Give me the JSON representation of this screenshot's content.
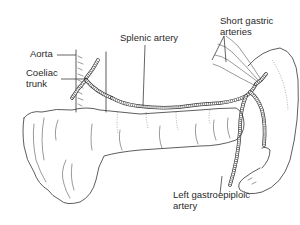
{
  "figure": {
    "labels": {
      "aorta": "Aorta",
      "coeliac_trunk_line1": "Coeliac",
      "coeliac_trunk_line2": "trunk",
      "splenic_artery": "Splenic artery",
      "short_gastric_line1": "Short gastric",
      "short_gastric_line2": "arteries",
      "left_gastroepiploic_line1": "Left gastroepiploic",
      "left_gastroepiploic_line2": "artery"
    },
    "structures": [
      "aorta",
      "coeliac-trunk",
      "splenic-artery",
      "pancreas",
      "spleen",
      "short-gastric-arteries",
      "left-gastroepiploic-artery"
    ],
    "colors": {
      "line": "#333333",
      "background": "#ffffff",
      "text": "#2a2a2a"
    }
  }
}
